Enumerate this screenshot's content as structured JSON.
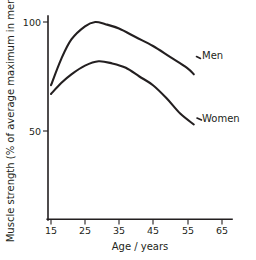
{
  "chart_data": {
    "type": "line",
    "title": "",
    "xlabel": "Age / years",
    "ylabel": "Muscle strength (% of average maximum in men)",
    "xlim": [
      13,
      70
    ],
    "ylim": [
      0,
      105
    ],
    "grid": false,
    "legend_position": "inline-right",
    "xticks": [
      15,
      25,
      35,
      45,
      55,
      65
    ],
    "xtick_labels": [
      "15",
      "25",
      "35",
      "45",
      "55",
      "65"
    ],
    "yticks": [
      50,
      100
    ],
    "ytick_labels": [
      "50",
      "100"
    ],
    "series": [
      {
        "name": "Men",
        "label": "Men",
        "color": "#231f20",
        "x": [
          15,
          18,
          21,
          25,
          28,
          31,
          35,
          40,
          45,
          50,
          55,
          57
        ],
        "values": [
          71,
          83,
          92,
          98,
          100,
          99,
          97,
          93,
          89,
          84,
          79,
          76
        ]
      },
      {
        "name": "Women",
        "label": "Women",
        "color": "#231f20",
        "x": [
          15,
          18,
          21,
          25,
          29,
          33,
          37,
          41,
          45,
          49,
          53,
          57
        ],
        "values": [
          67,
          72,
          76,
          80,
          82,
          81,
          79,
          75,
          71,
          65,
          58,
          53
        ]
      }
    ],
    "annotations": [
      {
        "text": "Men",
        "x": 60,
        "y": 76
      },
      {
        "text": "Women",
        "x": 60,
        "y": 53
      }
    ]
  }
}
